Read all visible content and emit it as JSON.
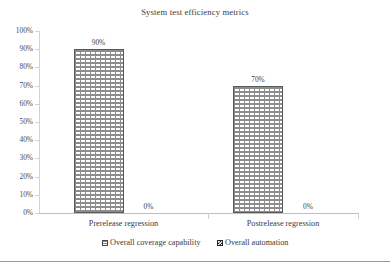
{
  "chart_data": {
    "type": "bar",
    "title": "System test efficiency metrics",
    "xlabel": "",
    "ylabel": "",
    "categories": [
      "Prerelease regression",
      "Postrelease regression"
    ],
    "series": [
      {
        "name": "Overall coverage capability",
        "values": [
          90,
          70
        ]
      },
      {
        "name": "Overall automation",
        "values": [
          0,
          0
        ]
      }
    ],
    "note_series_mapping": "bar 1 = Overall coverage capability, bar 2 = Overall automation",
    "data_labels": [
      "90%",
      "70%",
      "0%",
      "0%"
    ],
    "ylim": [
      0,
      100
    ],
    "ytick_labels": [
      "100%",
      "90%",
      "80%",
      "70%",
      "60%",
      "50%",
      "40%",
      "30%",
      "20%",
      "10%",
      "0%"
    ],
    "ytick_values": [
      100,
      90,
      80,
      70,
      60,
      50,
      40,
      30,
      20,
      10,
      0
    ],
    "grid": false,
    "legend_position": "bottom",
    "colors": {
      "series_0_pattern": "#8d8d8d",
      "series_1_pattern": "#1f1f1f",
      "axis": "#bfbfbf",
      "text": "#3a3a3a"
    }
  },
  "legend": {
    "items": [
      {
        "label": "Overall coverage capability"
      },
      {
        "label": "Overall automation"
      }
    ]
  }
}
